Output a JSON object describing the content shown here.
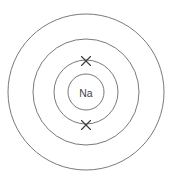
{
  "diagram": {
    "nucleus": {
      "label": "Na",
      "center_x": 86,
      "center_y": 92,
      "radius": 18
    },
    "shells": [
      {
        "name": "shell-1",
        "radius": 32
      },
      {
        "name": "shell-2",
        "radius": 53
      },
      {
        "name": "shell-3",
        "radius": 78
      }
    ],
    "electrons": [
      {
        "name": "electron-top",
        "symbol": "x",
        "x": 86,
        "y": 61,
        "size": 4.5
      },
      {
        "name": "electron-bottom",
        "symbol": "x",
        "x": 86,
        "y": 125,
        "size": 4.5
      }
    ],
    "colors": {
      "background": "#ffffff",
      "ring_stroke": "#6a6a6a",
      "electron_stroke": "#3a3a3a",
      "label_text": "#444444"
    }
  }
}
